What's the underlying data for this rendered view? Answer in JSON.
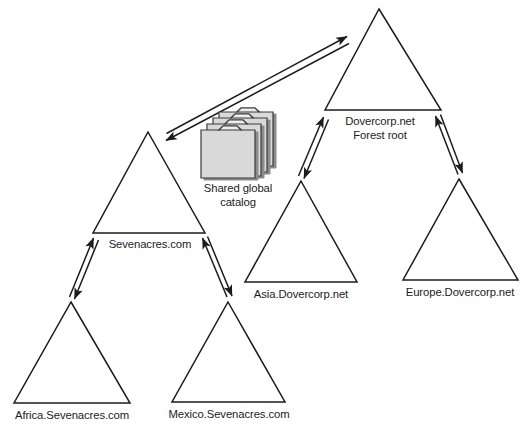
{
  "diagram": {
    "type": "tree-trust-diagram",
    "colors": {
      "line": "#1c1c1c",
      "text": "#1c1c1c",
      "folder_fill": "#d9d9d9",
      "folder_edge": "#3a3a3a",
      "folder_shadow": "#8c8c8c",
      "background": "#ffffff"
    },
    "domains": [
      {
        "id": "dovercorp",
        "label_line1": "Dovercorp.net",
        "label_line2": "Forest root",
        "apex": {
          "x": 379,
          "y": 9
        },
        "base_left": {
          "x": 325,
          "y": 110
        },
        "base_right": {
          "x": 441,
          "y": 110
        },
        "label_x": 380,
        "label_y": 115
      },
      {
        "id": "sevenacres",
        "label_line1": "Sevenacres.com",
        "label_line2": "",
        "apex": {
          "x": 148,
          "y": 132
        },
        "base_left": {
          "x": 93,
          "y": 233
        },
        "base_right": {
          "x": 205,
          "y": 233
        },
        "label_x": 150,
        "label_y": 238
      },
      {
        "id": "asia",
        "label_line1": "Asia.Dovercorp.net",
        "label_line2": "",
        "apex": {
          "x": 301,
          "y": 181
        },
        "base_left": {
          "x": 245,
          "y": 282
        },
        "base_right": {
          "x": 357,
          "y": 282
        },
        "label_x": 301,
        "label_y": 288
      },
      {
        "id": "europe",
        "label_line1": "Europe.Dovercorp.net",
        "label_line2": "",
        "apex": {
          "x": 459,
          "y": 179
        },
        "base_left": {
          "x": 403,
          "y": 280
        },
        "base_right": {
          "x": 518,
          "y": 280
        },
        "label_x": 460,
        "label_y": 286
      },
      {
        "id": "africa",
        "label_line1": "Africa.Sevenacres.com",
        "label_line2": "",
        "apex": {
          "x": 71,
          "y": 302
        },
        "base_left": {
          "x": 14,
          "y": 403
        },
        "base_right": {
          "x": 130,
          "y": 403
        },
        "label_x": 72,
        "label_y": 409
      },
      {
        "id": "mexico",
        "label_line1": "Mexico.Sevenacres.com",
        "label_line2": "",
        "apex": {
          "x": 228,
          "y": 302
        },
        "base_left": {
          "x": 172,
          "y": 402
        },
        "base_right": {
          "x": 285,
          "y": 402
        },
        "label_x": 229,
        "label_y": 408
      }
    ],
    "catalog": {
      "label_line1": "Shared global",
      "label_line2": "catalog",
      "label_x": 238,
      "label_y": 182,
      "icon": "folder-stack-icon",
      "folder_count": 4
    },
    "trusts": [
      {
        "id": "sevenacres-dovercorp",
        "from": "sevenacres",
        "to": "dovercorp",
        "kind": "forest-trust",
        "double_headed": true
      },
      {
        "id": "asia-dovercorp",
        "from": "asia",
        "to": "dovercorp",
        "kind": "parent-child-trust",
        "double_headed": true
      },
      {
        "id": "europe-dovercorp",
        "from": "europe",
        "to": "dovercorp",
        "kind": "parent-child-trust",
        "double_headed": true
      },
      {
        "id": "africa-sevenacres",
        "from": "africa",
        "to": "sevenacres",
        "kind": "parent-child-trust",
        "double_headed": true
      },
      {
        "id": "mexico-sevenacres",
        "from": "mexico",
        "to": "sevenacres",
        "kind": "parent-child-trust",
        "double_headed": true
      }
    ]
  }
}
